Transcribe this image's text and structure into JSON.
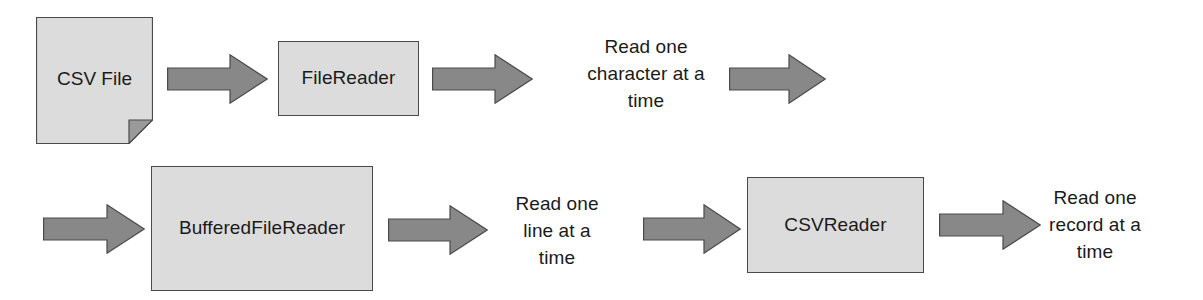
{
  "diagram": {
    "colors": {
      "node_fill": "#dcdcdc",
      "node_border": "#4a4a4a",
      "arrow_fill": "#888888",
      "arrow_border": "#4a4a4a",
      "text": "#1a1a1a",
      "background": "#ffffff"
    },
    "rows": [
      {
        "name": "top-row",
        "nodes": {
          "csv_file": {
            "label": "CSV File",
            "shape": "document"
          },
          "file_reader": {
            "label": "FileReader",
            "shape": "rectangle"
          }
        },
        "captions": {
          "read_character": "Read one\ncharacter at a\ntime"
        },
        "arrows": [
          {
            "name": "csv-file-to-file-reader",
            "direction": "right"
          },
          {
            "name": "file-reader-to-character-caption",
            "direction": "right"
          },
          {
            "name": "character-caption-to-next-row",
            "direction": "right"
          }
        ]
      },
      {
        "name": "bottom-row",
        "nodes": {
          "buffered_file_reader": {
            "label": "BufferedFileReader",
            "shape": "rectangle"
          },
          "csv_reader": {
            "label": "CSVReader",
            "shape": "rectangle"
          }
        },
        "captions": {
          "read_line": "Read one\nline at a\ntime",
          "read_record": "Read one\nrecord at a\ntime"
        },
        "arrows": [
          {
            "name": "continuation-to-buffered-file-reader",
            "direction": "right"
          },
          {
            "name": "buffered-file-reader-to-line-caption",
            "direction": "right"
          },
          {
            "name": "line-caption-to-csv-reader",
            "direction": "right"
          },
          {
            "name": "csv-reader-to-record-caption",
            "direction": "right"
          }
        ]
      }
    ],
    "caption_lines": {
      "read_character": [
        "Read one",
        "character at a",
        "time"
      ],
      "read_line": [
        "Read one",
        "line at a",
        "time"
      ],
      "read_record": [
        "Read one",
        "record at a",
        "time"
      ]
    }
  }
}
